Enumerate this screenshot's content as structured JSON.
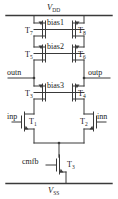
{
  "diagram": {
    "type": "circuit-schematic",
    "colors": {
      "wire": "#3a3a3a",
      "text": "#1a1a1a",
      "background": "#ffffff"
    }
  },
  "rails": {
    "top": {
      "name": "VDD",
      "symbol": "V",
      "subscript": "DD"
    },
    "bottom": {
      "name": "VSS",
      "symbol": "V",
      "subscript": "SS"
    }
  },
  "bias_nets": [
    {
      "id": "bias1",
      "label": "bias1"
    },
    {
      "id": "bias2",
      "label": "bias2"
    },
    {
      "id": "bias3",
      "label": "bias3"
    }
  ],
  "ports": [
    {
      "id": "inp",
      "label": "inp",
      "side": "left",
      "kind": "input"
    },
    {
      "id": "inn",
      "label": "inn",
      "side": "right",
      "kind": "input"
    },
    {
      "id": "outn",
      "label": "outn",
      "side": "left",
      "kind": "output"
    },
    {
      "id": "outp",
      "label": "outp",
      "side": "right",
      "kind": "output"
    },
    {
      "id": "cmfb",
      "label": "cmfb",
      "side": "left",
      "kind": "input"
    }
  ],
  "transistors": [
    {
      "id": "T1",
      "symbol": "T",
      "index": "1",
      "type": "nmos",
      "role": "input-pair-left",
      "gate_net": "inp"
    },
    {
      "id": "T2",
      "symbol": "T",
      "index": "2",
      "type": "nmos",
      "role": "input-pair-right",
      "gate_net": "inn"
    },
    {
      "id": "T3",
      "symbol": "T",
      "index": "3",
      "type": "nmos",
      "role": "tail-current-source",
      "gate_net": "cmfb"
    },
    {
      "id": "T3c",
      "symbol": "T",
      "index": "3",
      "type": "nmos",
      "role": "cascode-left",
      "gate_net": "bias3"
    },
    {
      "id": "T4",
      "symbol": "T",
      "index": "4",
      "type": "nmos",
      "role": "cascode-right",
      "gate_net": "bias3"
    },
    {
      "id": "T5",
      "symbol": "T",
      "index": "5",
      "type": "pmos",
      "role": "cascode-left",
      "gate_net": "bias2"
    },
    {
      "id": "T6",
      "symbol": "T",
      "index": "6",
      "type": "pmos",
      "role": "cascode-right",
      "gate_net": "bias2"
    },
    {
      "id": "T7",
      "symbol": "T",
      "index": "7",
      "type": "pmos",
      "role": "load-left",
      "gate_net": "bias1"
    },
    {
      "id": "T8",
      "symbol": "T",
      "index": "8",
      "type": "pmos",
      "role": "load-right",
      "gate_net": "bias1"
    }
  ],
  "labels": {
    "T7": "T",
    "T7_sub": "7",
    "T8": "T",
    "T8_sub": "8",
    "T5": "T",
    "T5_sub": "5",
    "T6": "T",
    "T6_sub": "6",
    "T3c": "T",
    "T3c_sub": "3",
    "T4": "T",
    "T4_sub": "4",
    "T1": "T",
    "T1_sub": "1",
    "T2": "T",
    "T2_sub": "2",
    "T3": "T",
    "T3_sub": "3",
    "bias1": "bias1",
    "bias2": "bias2",
    "bias3": "bias3",
    "inp": "inp",
    "inn": "inn",
    "outn": "outn",
    "outp": "outp",
    "cmfb": "cmfb",
    "vdd_sym": "V",
    "vdd_sub": "DD",
    "vss_sym": "V",
    "vss_sub": "SS"
  }
}
